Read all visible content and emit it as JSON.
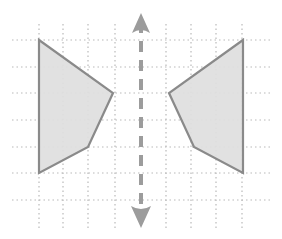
{
  "figure": {
    "canvas": {
      "width": 282,
      "height": 239,
      "background": "#ffffff"
    }
  },
  "chart_data": {
    "type": "scatter",
    "subtitle": "",
    "xlabel": "",
    "ylabel": "",
    "grid": true,
    "legend": false,
    "legend_position": "none",
    "xlim": [
      0,
      282
    ],
    "ylim": [
      239,
      0
    ],
    "grid_spec": {
      "vertical_lines_px": [
        39,
        63,
        88,
        115,
        141,
        166,
        191,
        216,
        242
      ],
      "horizontal_lines_px": [
        40,
        67,
        93,
        120,
        147,
        173,
        200
      ],
      "cell_width_px": 25,
      "cell_height_px": 27,
      "grid_color": "#b9b9b9",
      "grid_dash": "1.5 3",
      "grid_width": 1.2,
      "vertical_extent_px": [
        24,
        228
      ],
      "horizontal_extent_px": [
        12,
        272
      ]
    },
    "axis_of_symmetry": {
      "label": "line of reflection",
      "orientation": "vertical",
      "x_px": 141,
      "y_start_px": 22,
      "y_end_px": 214,
      "color": "#9c9c9c",
      "width": 4,
      "dash": "11 8",
      "arrow_top": {
        "tip_y_px": 13,
        "base_y_px": 33,
        "half_width_px": 9
      },
      "arrow_bottom": {
        "tip_y_px": 228,
        "base_y_px": 206,
        "half_width_px": 10
      }
    },
    "series": [
      {
        "name": "pre-image-left-quadrilateral",
        "shape": "quadrilateral",
        "fill": "#dedede",
        "stroke": "#8a8a8a",
        "stroke_width": 2.2,
        "x": [
          39,
          113,
          88,
          39
        ],
        "y": [
          40,
          93,
          147,
          173
        ],
        "vertices_px": [
          [
            39,
            40
          ],
          [
            113,
            93
          ],
          [
            88,
            147
          ],
          [
            39,
            173
          ]
        ],
        "vertices_grid": [
          [
            0,
            0
          ],
          [
            3,
            2
          ],
          [
            2,
            4
          ],
          [
            0,
            5
          ]
        ]
      },
      {
        "name": "image-right-quadrilateral",
        "shape": "quadrilateral",
        "fill": "#dedede",
        "stroke": "#8a8a8a",
        "stroke_width": 2.2,
        "x": [
          243,
          169,
          194,
          243
        ],
        "y": [
          40,
          93,
          147,
          173
        ],
        "vertices_px": [
          [
            243,
            40
          ],
          [
            169,
            93
          ],
          [
            194,
            147
          ],
          [
            243,
            173
          ]
        ],
        "vertices_grid": [
          [
            8,
            0
          ],
          [
            5,
            2
          ],
          [
            6,
            4
          ],
          [
            8,
            5
          ]
        ]
      }
    ],
    "annotations": [
      {
        "name": "up-arrow-head",
        "type": "arrowhead",
        "direction": "up",
        "x_px": 141,
        "y_px": 13
      },
      {
        "name": "down-arrow-head",
        "type": "arrowhead",
        "direction": "down",
        "x_px": 141,
        "y_px": 228
      }
    ]
  },
  "colors": {
    "shape_fill": "#dedede",
    "shape_stroke": "#8a8a8a",
    "grid_line": "#b9b9b9",
    "axis_line": "#9c9c9c",
    "background": "#ffffff"
  }
}
